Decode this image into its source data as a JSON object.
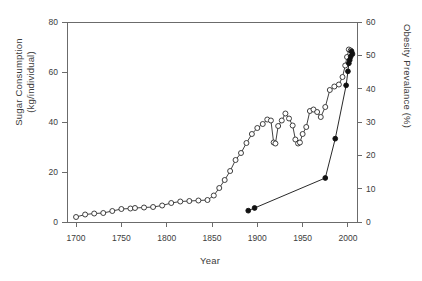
{
  "chart_data": {
    "type": "line",
    "title": "",
    "xlabel": "Year",
    "ylabel": "Sugar Consumption (kg/individual)",
    "y2label": "Obesity Prevalance (%)",
    "xlim": [
      1690,
      2010
    ],
    "ylim": [
      0,
      80
    ],
    "y2lim": [
      0,
      60
    ],
    "xticks": [
      1700,
      1750,
      1800,
      1850,
      1900,
      1950,
      2000
    ],
    "yticks": [
      0,
      20,
      40,
      60,
      80
    ],
    "y2ticks": [
      0,
      10,
      20,
      30,
      40,
      50,
      60
    ],
    "grid": false,
    "legend": "none",
    "series": [
      {
        "name": "Sugar Consumption",
        "axis": "left",
        "marker": "open-circle",
        "color": "#2b2b2b",
        "points": [
          [
            1700,
            2.0
          ],
          [
            1710,
            3.0
          ],
          [
            1720,
            3.4
          ],
          [
            1730,
            3.6
          ],
          [
            1740,
            4.4
          ],
          [
            1750,
            5.2
          ],
          [
            1760,
            5.4
          ],
          [
            1765,
            5.6
          ],
          [
            1775,
            5.8
          ],
          [
            1785,
            6.0
          ],
          [
            1795,
            6.6
          ],
          [
            1805,
            7.6
          ],
          [
            1815,
            8.2
          ],
          [
            1825,
            8.4
          ],
          [
            1835,
            8.6
          ],
          [
            1845,
            8.8
          ],
          [
            1852,
            10.6
          ],
          [
            1858,
            13.6
          ],
          [
            1864,
            16.8
          ],
          [
            1870,
            20.4
          ],
          [
            1876,
            24.8
          ],
          [
            1882,
            27.6
          ],
          [
            1888,
            31.6
          ],
          [
            1894,
            35.2
          ],
          [
            1900,
            37.6
          ],
          [
            1906,
            39.2
          ],
          [
            1911,
            41.0
          ],
          [
            1915,
            40.6
          ],
          [
            1918,
            31.8
          ],
          [
            1920,
            31.4
          ],
          [
            1923,
            38.4
          ],
          [
            1927,
            40.6
          ],
          [
            1931,
            43.4
          ],
          [
            1935,
            41.4
          ],
          [
            1939,
            38.6
          ],
          [
            1942,
            33.0
          ],
          [
            1945,
            31.4
          ],
          [
            1947,
            31.8
          ],
          [
            1950,
            35.2
          ],
          [
            1954,
            38.0
          ],
          [
            1958,
            44.4
          ],
          [
            1962,
            45.0
          ],
          [
            1966,
            44.0
          ],
          [
            1970,
            42.0
          ],
          [
            1975,
            46.0
          ],
          [
            1980,
            52.8
          ],
          [
            1985,
            54.2
          ],
          [
            1990,
            55.0
          ],
          [
            1994,
            58.0
          ],
          [
            1997,
            62.6
          ],
          [
            1999,
            66.0
          ],
          [
            2001,
            69.0
          ],
          [
            2003,
            68.6
          ]
        ]
      },
      {
        "name": "Obesity Prevalance",
        "axis": "right",
        "marker": "filled-circle",
        "color": "#111111",
        "points": [
          [
            1890,
            3.4
          ],
          [
            1897,
            4.2
          ],
          [
            1975,
            13.2
          ],
          [
            1986,
            25.0
          ],
          [
            1998,
            41.0
          ],
          [
            2000,
            45.2
          ],
          [
            2001,
            47.6
          ],
          [
            2002,
            48.6
          ],
          [
            2003,
            49.6
          ],
          [
            2004,
            51.2
          ],
          [
            2005,
            50.4
          ]
        ]
      }
    ]
  },
  "axes": {
    "left_title_line1": "Sugar Consumption",
    "left_title_line2": "(kg/individual)",
    "right_title": "Obesity Prevalance (%)",
    "bottom_title": "Year"
  },
  "colors": {
    "axis": "#6b6b6b",
    "sugar_series": "#2b2b2b",
    "obesity_series": "#111111",
    "background": "#ffffff"
  }
}
